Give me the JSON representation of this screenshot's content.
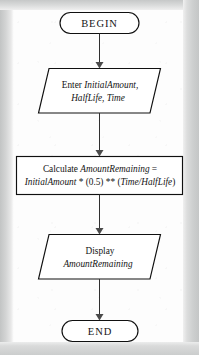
{
  "document": {
    "type": "flowchart",
    "title": "Half-Life Decay Flowchart",
    "background_color": "#fdfdfd",
    "border_color": "#c9cbcb",
    "line_color": "#101010"
  },
  "nodes": {
    "begin": {
      "shape": "terminator",
      "label": "BEGIN"
    },
    "input": {
      "shape": "parallelogram",
      "line1_keyword": "Enter ",
      "line1_vars": "InitialAmount,",
      "line2_vars": "HalfLife, Time"
    },
    "process": {
      "shape": "rectangle",
      "line1_keyword": "Calculate ",
      "line1_var": "AmountRemaining",
      "line1_op": " =",
      "line2_var1": "InitialAmount",
      "line2_mid": " * (0.5) ** (",
      "line2_var2": "Time/HalfLife",
      "line2_end": ")"
    },
    "output": {
      "shape": "parallelogram",
      "line1_keyword": "Display",
      "line2_var": "AmountRemaining"
    },
    "end": {
      "shape": "terminator",
      "label": "END"
    }
  },
  "connectors": [
    {
      "name": "begin-to-input",
      "from": "begin",
      "to": "input",
      "arrow": "down"
    },
    {
      "name": "input-to-process",
      "from": "input",
      "to": "process",
      "arrow": "down"
    },
    {
      "name": "process-to-output",
      "from": "process",
      "to": "output",
      "arrow": "down"
    },
    {
      "name": "output-to-end",
      "from": "output",
      "to": "end",
      "arrow": "down"
    }
  ]
}
